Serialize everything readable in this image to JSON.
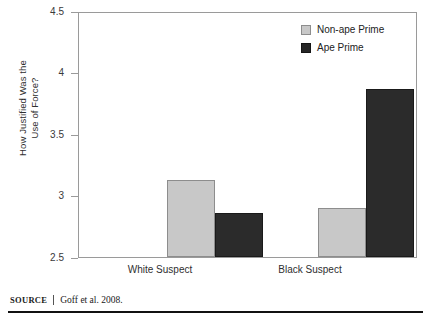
{
  "figure": {
    "source_word": "Source",
    "source_text": "Goff et al. 2008."
  },
  "chart_data": {
    "type": "bar",
    "title": "",
    "xlabel": "",
    "ylabel": "How Justified Was the Use of Force?",
    "ylabel_lines": [
      "How Justified Was the",
      "Use of Force?"
    ],
    "categories": [
      "White Suspect",
      "Black Suspect"
    ],
    "series": [
      {
        "name": "Non-ape Prime",
        "color": "#c8c8c8",
        "values": [
          3.13,
          2.9
        ]
      },
      {
        "name": "Ape Prime",
        "color": "#262626",
        "values": [
          2.86,
          3.88
        ]
      }
    ],
    "ylim": [
      2.5,
      4.5
    ],
    "yticks": [
      "2.5",
      "3",
      "3.5",
      "4",
      "4.5"
    ],
    "ytick_values": [
      2.5,
      3,
      3.5,
      4,
      4.5
    ],
    "grid": false,
    "legend_position": "top-right"
  }
}
